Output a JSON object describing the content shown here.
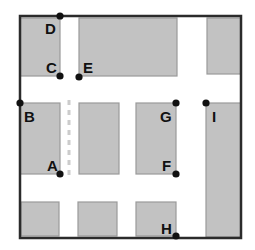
{
  "diagram": {
    "colors": {
      "background": "#ffffff",
      "block_fill": "#c2c2c2",
      "block_stroke": "#9a9a9a",
      "frame_stroke": "#2b2b2b",
      "point_fill": "#111111",
      "label_color": "#111111",
      "dashed_line": "#cccccc"
    },
    "frame": {
      "x": 20,
      "y": 16,
      "width": 221,
      "height": 222,
      "stroke_width": 2.5
    },
    "dashed_line": {
      "x": 69,
      "y1": 100,
      "y2": 180,
      "dash": "5 5",
      "stroke_width": 3
    },
    "blocks": [
      {
        "name": "block-top-left",
        "x": 20,
        "y": 18,
        "width": 40,
        "height": 58
      },
      {
        "name": "block-top-center",
        "x": 79,
        "y": 18,
        "width": 98,
        "height": 58
      },
      {
        "name": "block-top-right",
        "x": 207,
        "y": 18,
        "width": 34,
        "height": 56
      },
      {
        "name": "block-mid-left",
        "x": 20,
        "y": 103,
        "width": 40,
        "height": 71
      },
      {
        "name": "block-mid-center",
        "x": 79,
        "y": 103,
        "width": 40,
        "height": 71
      },
      {
        "name": "block-mid-right",
        "x": 136,
        "y": 103,
        "width": 40,
        "height": 71
      },
      {
        "name": "block-right-column",
        "x": 206,
        "y": 103,
        "width": 35,
        "height": 134
      },
      {
        "name": "block-bottom-left",
        "x": 21,
        "y": 202,
        "width": 38,
        "height": 34
      },
      {
        "name": "block-bottom-center",
        "x": 78,
        "y": 202,
        "width": 39,
        "height": 34
      },
      {
        "name": "block-bottom-right",
        "x": 136,
        "y": 202,
        "width": 40,
        "height": 34
      }
    ],
    "points": [
      {
        "id": "A",
        "cx": 60,
        "cy": 174,
        "label_x": 47,
        "label_y": 171
      },
      {
        "id": "B",
        "cx": 20,
        "cy": 103,
        "label_x": 24,
        "label_y": 122
      },
      {
        "id": "C",
        "cx": 60,
        "cy": 76,
        "label_x": 46,
        "label_y": 73
      },
      {
        "id": "D",
        "cx": 60,
        "cy": 16,
        "label_x": 45,
        "label_y": 34
      },
      {
        "id": "E",
        "cx": 79,
        "cy": 77,
        "label_x": 83,
        "label_y": 73
      },
      {
        "id": "F",
        "cx": 176,
        "cy": 174,
        "label_x": 162,
        "label_y": 171
      },
      {
        "id": "G",
        "cx": 176,
        "cy": 103,
        "label_x": 160,
        "label_y": 122
      },
      {
        "id": "H",
        "cx": 176,
        "cy": 236,
        "label_x": 161,
        "label_y": 234
      },
      {
        "id": "I",
        "cx": 206,
        "cy": 103,
        "label_x": 212,
        "label_y": 122
      }
    ],
    "point_radius": 3.6
  }
}
